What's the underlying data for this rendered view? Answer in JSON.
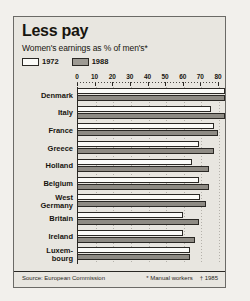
{
  "panel": {
    "title": "Less pay",
    "subtitle": "Women's earnings as % of men's*",
    "source": "Source: European Commission",
    "note_manual": "* Manual workers",
    "note_year": "† 1985"
  },
  "legend": [
    {
      "label": "1972",
      "color": "#fbfbf8",
      "swatch": "sw-1972"
    },
    {
      "label": "1988",
      "color": "#8e8b84",
      "swatch": "sw-1988"
    }
  ],
  "chart_data": {
    "type": "bar",
    "orientation": "horizontal",
    "title": "Less pay",
    "subtitle": "Women's earnings as % of men's*",
    "xlabel": "",
    "ylabel": "",
    "xlim": [
      0,
      80
    ],
    "ticks": [
      0,
      10,
      20,
      30,
      40,
      50,
      60,
      70,
      80
    ],
    "grid": true,
    "legend_position": "top-left",
    "categories": [
      "Denmark",
      "Italy",
      "France",
      "Greece",
      "Holland",
      "Belgium",
      "West Germany",
      "Britain",
      "Ireland",
      "Luxembourg"
    ],
    "category_lines": [
      [
        "Denmark"
      ],
      [
        "Italy"
      ],
      [
        "France"
      ],
      [
        "Greece"
      ],
      [
        "Holland"
      ],
      [
        "Belgium"
      ],
      [
        "West",
        "Germany"
      ],
      [
        "Britain"
      ],
      [
        "Ireland"
      ],
      [
        "Luxem-",
        "bourg"
      ]
    ],
    "series": [
      {
        "name": "1972",
        "values": [
          84,
          76,
          78,
          69,
          65,
          69,
          70,
          60,
          60,
          64
        ]
      },
      {
        "name": "1988",
        "values": [
          84,
          84,
          80,
          78,
          75,
          75,
          73,
          69,
          67,
          64
        ]
      }
    ],
    "source": "Source: European Commission",
    "annotations": [
      "* Manual workers",
      "† 1985"
    ]
  }
}
